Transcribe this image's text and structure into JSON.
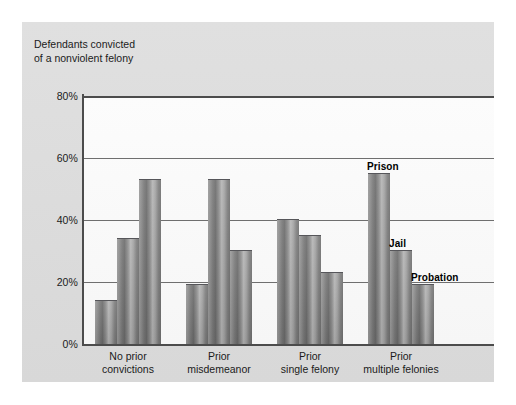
{
  "chart_data": {
    "type": "bar",
    "title": "",
    "axis_note": "Defendants convicted\nof a nonviolent felony",
    "xlabel": "",
    "ylabel": "",
    "ylim": [
      0,
      80
    ],
    "yticks": [
      "0%",
      "20%",
      "40%",
      "60%",
      "80%"
    ],
    "ytick_values": [
      0,
      20,
      40,
      60,
      80
    ],
    "grid": "horizontal",
    "legend_position": "inline-annotations-on-last-group",
    "categories": [
      "No prior\nconvictions",
      "Prior\nmisdemeanor",
      "Prior\nsingle felony",
      "Prior\nmultiple felonies"
    ],
    "series": [
      {
        "name": "Prison",
        "values": [
          14,
          19,
          40,
          55
        ]
      },
      {
        "name": "Jail",
        "values": [
          34,
          53,
          35,
          30
        ]
      },
      {
        "name": "Probation",
        "values": [
          53,
          30,
          23,
          19
        ]
      }
    ],
    "annotations": [
      {
        "text": "Prison",
        "group": 3,
        "series": 0
      },
      {
        "text": "Jail",
        "group": 3,
        "series": 1
      },
      {
        "text": "Probation",
        "group": 3,
        "series": 2
      }
    ],
    "colors": {
      "panel_background": "#dcdcdc",
      "plot_background": "#fbfbfb",
      "bar_fill": "#8a8a8a",
      "axis": "#4c4c4c",
      "gridline": "#6f6f6f",
      "text": "#1b1b1b"
    }
  }
}
